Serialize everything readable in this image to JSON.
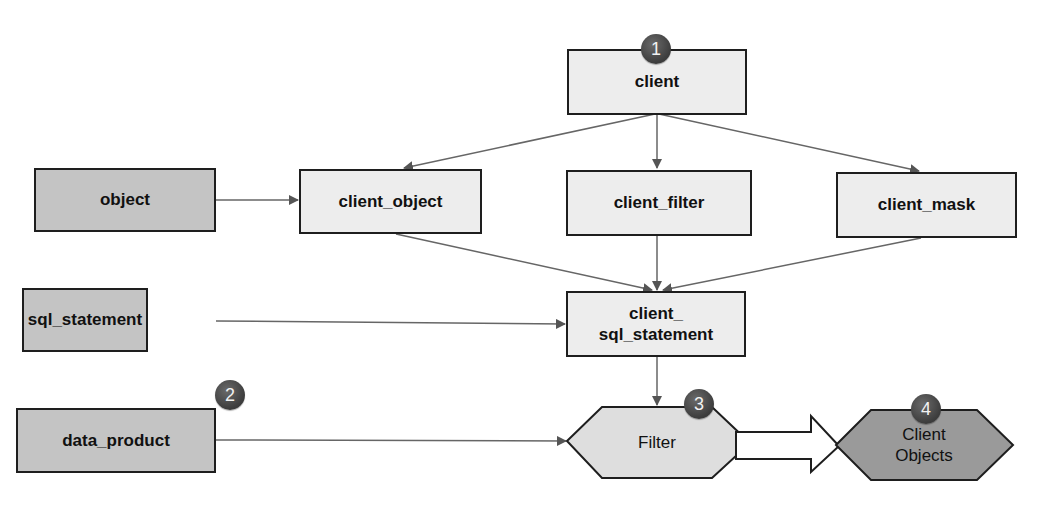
{
  "diagram": {
    "colors": {
      "light_fill": "#ededed",
      "dark_fill": "#c4c4c4",
      "filter_fill": "#dedede",
      "client_objects_fill": "#9a9a9a",
      "border": "#1e1e1e",
      "arrow": "#555555",
      "badge": "#4a4a4a"
    },
    "nodes": {
      "client": {
        "label": "client",
        "badge": "1"
      },
      "object": {
        "label": "object"
      },
      "client_object": {
        "label": "client_object"
      },
      "client_filter": {
        "label": "client_filter"
      },
      "client_mask": {
        "label": "client_mask"
      },
      "sql_statement": {
        "label": "sql_statement"
      },
      "client_sql_statement": {
        "label_line1": "client_",
        "label_line2": "sql_statement"
      },
      "data_product": {
        "label": "data_product",
        "badge": "2"
      },
      "filter": {
        "label": "Filter",
        "badge": "3"
      },
      "client_objects": {
        "label_line1": "Client",
        "label_line2": "Objects",
        "badge": "4"
      }
    },
    "edges": [
      {
        "from": "client",
        "to": "client_object"
      },
      {
        "from": "client",
        "to": "client_filter"
      },
      {
        "from": "client",
        "to": "client_mask"
      },
      {
        "from": "object",
        "to": "client_object"
      },
      {
        "from": "client_object",
        "to": "client_sql_statement"
      },
      {
        "from": "client_filter",
        "to": "client_sql_statement"
      },
      {
        "from": "client_mask",
        "to": "client_sql_statement"
      },
      {
        "from": "sql_statement",
        "to": "client_sql_statement"
      },
      {
        "from": "client_sql_statement",
        "to": "filter"
      },
      {
        "from": "data_product",
        "to": "filter"
      },
      {
        "from": "filter",
        "to": "client_objects",
        "style": "block-arrow"
      }
    ]
  }
}
